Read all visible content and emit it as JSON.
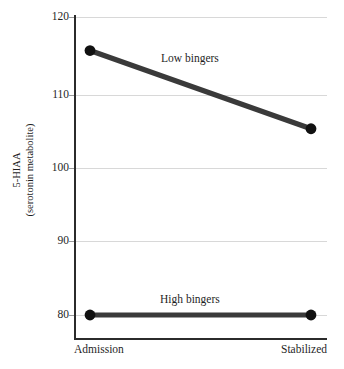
{
  "chart_data": {
    "type": "line",
    "title": "",
    "subtitle": "",
    "xlabel": "",
    "ylabel": "5-HIAA\n(serotonin metabolite)",
    "ylabel_line1": "5-HIAA",
    "ylabel_line2": "(serotonin metabolite)",
    "categories": [
      "Admission",
      "Stabilized"
    ],
    "x": [
      0,
      1
    ],
    "xlim": [
      0,
      1
    ],
    "ylim": [
      80,
      120
    ],
    "yticks": [
      80,
      90,
      100,
      110,
      120
    ],
    "ytick_labels": [
      "80",
      "90",
      "100",
      "110",
      "120"
    ],
    "xtick_labels": [
      "Admission",
      "Stabilized"
    ],
    "grid": "horizontal",
    "legend": "inline-annotations",
    "series": [
      {
        "name": "Low bingers",
        "label": "Low bingers",
        "values": [
          115.5,
          105.0
        ],
        "color": "#3a3a3a",
        "marker": "circle",
        "annotation": "Low bingers"
      },
      {
        "name": "High bingers",
        "label": "High bingers",
        "values": [
          80.0,
          80.0
        ],
        "color": "#3a3a3a",
        "marker": "circle",
        "annotation": "High bingers"
      }
    ],
    "colors": {
      "line": "#3a3a3a",
      "marker": "#111111",
      "grid": "#d8d8d8",
      "axis": "#2b2b2b",
      "text": "#1f1f1f",
      "background": "#ffffff"
    }
  }
}
